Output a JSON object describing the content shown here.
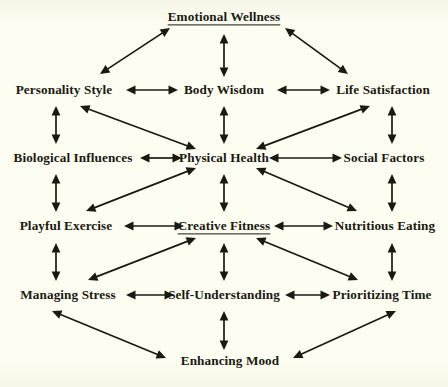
{
  "diagram": {
    "title": "Emotional Wellness",
    "background_color": "#fdfdf1",
    "ink_color": "#1b1a12",
    "nodes": [
      {
        "id": "emotional-wellness",
        "label": "Emotional Wellness",
        "x": 224,
        "y": 17,
        "underlined": true
      },
      {
        "id": "personality-style",
        "label": "Personality Style",
        "x": 64,
        "y": 90,
        "underlined": false
      },
      {
        "id": "body-wisdom",
        "label": "Body Wisdom",
        "x": 224,
        "y": 90,
        "underlined": false
      },
      {
        "id": "life-satisfaction",
        "label": "Life Satisfaction",
        "x": 383,
        "y": 90,
        "underlined": false
      },
      {
        "id": "biological-influences",
        "label": "Biological Influences",
        "x": 73,
        "y": 158,
        "underlined": false
      },
      {
        "id": "physical-health",
        "label": "Physical Health",
        "x": 224,
        "y": 158,
        "underlined": false
      },
      {
        "id": "social-factors",
        "label": "Social Factors",
        "x": 384,
        "y": 158,
        "underlined": false
      },
      {
        "id": "playful-exercise",
        "label": "Playful Exercise",
        "x": 66,
        "y": 226,
        "underlined": false
      },
      {
        "id": "creative-fitness",
        "label": "Creative Fitness",
        "x": 224,
        "y": 226,
        "underlined": true
      },
      {
        "id": "nutritious-eating",
        "label": "Nutritious Eating",
        "x": 385,
        "y": 226,
        "underlined": false
      },
      {
        "id": "managing-stress",
        "label": "Managing Stress",
        "x": 68,
        "y": 295,
        "underlined": false
      },
      {
        "id": "self-understanding",
        "label": "Self-Understanding",
        "x": 224,
        "y": 295,
        "underlined": false
      },
      {
        "id": "prioritizing-time",
        "label": "Prioritizing Time",
        "x": 382,
        "y": 295,
        "underlined": false
      },
      {
        "id": "enhancing-mood",
        "label": "Enhancing Mood",
        "x": 230,
        "y": 361,
        "underlined": false
      }
    ],
    "edges": [
      {
        "from": "personality-style",
        "to": "emotional-wellness",
        "type": "diagonal",
        "bidirectional": true
      },
      {
        "from": "life-satisfaction",
        "to": "emotional-wellness",
        "type": "diagonal",
        "bidirectional": true
      },
      {
        "from": "body-wisdom",
        "to": "emotional-wellness",
        "type": "vertical",
        "bidirectional": true
      },
      {
        "from": "personality-style",
        "to": "body-wisdom",
        "type": "horizontal",
        "bidirectional": true
      },
      {
        "from": "body-wisdom",
        "to": "life-satisfaction",
        "type": "horizontal",
        "bidirectional": true
      },
      {
        "from": "personality-style",
        "to": "biological-influences",
        "type": "vertical",
        "bidirectional": true
      },
      {
        "from": "body-wisdom",
        "to": "physical-health",
        "type": "vertical",
        "bidirectional": true
      },
      {
        "from": "life-satisfaction",
        "to": "social-factors",
        "type": "vertical",
        "bidirectional": true
      },
      {
        "from": "physical-health",
        "to": "personality-style",
        "type": "diagonal",
        "bidirectional": true
      },
      {
        "from": "physical-health",
        "to": "life-satisfaction",
        "type": "diagonal",
        "bidirectional": true
      },
      {
        "from": "biological-influences",
        "to": "physical-health",
        "type": "horizontal",
        "bidirectional": true
      },
      {
        "from": "physical-health",
        "to": "social-factors",
        "type": "horizontal",
        "bidirectional": true
      },
      {
        "from": "biological-influences",
        "to": "playful-exercise",
        "type": "vertical",
        "bidirectional": true
      },
      {
        "from": "physical-health",
        "to": "creative-fitness",
        "type": "vertical",
        "bidirectional": true
      },
      {
        "from": "social-factors",
        "to": "nutritious-eating",
        "type": "vertical",
        "bidirectional": true
      },
      {
        "from": "physical-health",
        "to": "playful-exercise",
        "type": "diagonal",
        "bidirectional": true
      },
      {
        "from": "physical-health",
        "to": "nutritious-eating",
        "type": "diagonal",
        "bidirectional": true
      },
      {
        "from": "playful-exercise",
        "to": "creative-fitness",
        "type": "horizontal",
        "bidirectional": true
      },
      {
        "from": "creative-fitness",
        "to": "nutritious-eating",
        "type": "horizontal",
        "bidirectional": true
      },
      {
        "from": "playful-exercise",
        "to": "managing-stress",
        "type": "vertical",
        "bidirectional": true
      },
      {
        "from": "creative-fitness",
        "to": "self-understanding",
        "type": "vertical",
        "bidirectional": true
      },
      {
        "from": "nutritious-eating",
        "to": "prioritizing-time",
        "type": "vertical",
        "bidirectional": true
      },
      {
        "from": "creative-fitness",
        "to": "managing-stress",
        "type": "diagonal",
        "bidirectional": true
      },
      {
        "from": "creative-fitness",
        "to": "prioritizing-time",
        "type": "diagonal",
        "bidirectional": true
      },
      {
        "from": "managing-stress",
        "to": "self-understanding",
        "type": "horizontal",
        "bidirectional": true
      },
      {
        "from": "self-understanding",
        "to": "prioritizing-time",
        "type": "horizontal",
        "bidirectional": true
      },
      {
        "from": "self-understanding",
        "to": "enhancing-mood",
        "type": "vertical",
        "bidirectional": true
      },
      {
        "from": "managing-stress",
        "to": "enhancing-mood",
        "type": "diagonal",
        "bidirectional": true
      },
      {
        "from": "prioritizing-time",
        "to": "enhancing-mood",
        "type": "diagonal",
        "bidirectional": true
      }
    ],
    "arrow_segments": [
      {
        "name": "pstyle-ewell",
        "x1": 100,
        "y1": 74,
        "x2": 170,
        "y2": 28
      },
      {
        "name": "lsat-ewell",
        "x1": 348,
        "y1": 74,
        "x2": 285,
        "y2": 28
      },
      {
        "name": "bwisdom-ewell",
        "x1": 224,
        "y1": 77,
        "x2": 224,
        "y2": 34
      },
      {
        "name": "pstyle-bwisdom",
        "x1": 126,
        "y1": 90,
        "x2": 178,
        "y2": 90
      },
      {
        "name": "bwisdom-lsat",
        "x1": 277,
        "y1": 90,
        "x2": 330,
        "y2": 90
      },
      {
        "name": "pstyle-bio",
        "x1": 56,
        "y1": 106,
        "x2": 56,
        "y2": 144
      },
      {
        "name": "bwisdom-phys",
        "x1": 224,
        "y1": 106,
        "x2": 224,
        "y2": 144
      },
      {
        "name": "lsat-social",
        "x1": 392,
        "y1": 106,
        "x2": 392,
        "y2": 144
      },
      {
        "name": "phys-pstyle",
        "x1": 196,
        "y1": 149,
        "x2": 80,
        "y2": 106
      },
      {
        "name": "phys-lsat",
        "x1": 256,
        "y1": 149,
        "x2": 370,
        "y2": 106
      },
      {
        "name": "bio-phys",
        "x1": 140,
        "y1": 158,
        "x2": 182,
        "y2": 158
      },
      {
        "name": "phys-social",
        "x1": 269,
        "y1": 158,
        "x2": 342,
        "y2": 158
      },
      {
        "name": "bio-playful",
        "x1": 56,
        "y1": 174,
        "x2": 56,
        "y2": 212
      },
      {
        "name": "phys-creative",
        "x1": 224,
        "y1": 174,
        "x2": 224,
        "y2": 212
      },
      {
        "name": "social-nutri",
        "x1": 392,
        "y1": 174,
        "x2": 392,
        "y2": 212
      },
      {
        "name": "phys-playful",
        "x1": 196,
        "y1": 168,
        "x2": 86,
        "y2": 211
      },
      {
        "name": "phys-nutri",
        "x1": 256,
        "y1": 168,
        "x2": 357,
        "y2": 211
      },
      {
        "name": "playful-creat",
        "x1": 124,
        "y1": 226,
        "x2": 184,
        "y2": 226
      },
      {
        "name": "creat-nutri",
        "x1": 274,
        "y1": 226,
        "x2": 333,
        "y2": 226
      },
      {
        "name": "playful-manage",
        "x1": 56,
        "y1": 243,
        "x2": 56,
        "y2": 281
      },
      {
        "name": "creat-self",
        "x1": 224,
        "y1": 243,
        "x2": 224,
        "y2": 281
      },
      {
        "name": "nutri-prior",
        "x1": 392,
        "y1": 243,
        "x2": 392,
        "y2": 281
      },
      {
        "name": "creat-manage",
        "x1": 196,
        "y1": 238,
        "x2": 88,
        "y2": 280
      },
      {
        "name": "creat-prior",
        "x1": 256,
        "y1": 238,
        "x2": 358,
        "y2": 280
      },
      {
        "name": "manage-self",
        "x1": 126,
        "y1": 295,
        "x2": 174,
        "y2": 295
      },
      {
        "name": "self-prior",
        "x1": 285,
        "y1": 295,
        "x2": 330,
        "y2": 295
      },
      {
        "name": "self-enhance",
        "x1": 224,
        "y1": 311,
        "x2": 224,
        "y2": 350
      },
      {
        "name": "manage-enhance",
        "x1": 52,
        "y1": 311,
        "x2": 166,
        "y2": 358
      },
      {
        "name": "prior-enhance",
        "x1": 396,
        "y1": 311,
        "x2": 293,
        "y2": 358
      }
    ]
  }
}
